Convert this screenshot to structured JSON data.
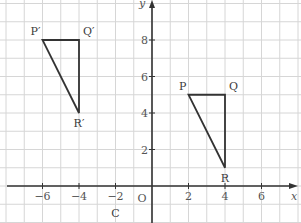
{
  "diagram": {
    "type": "coordinate-grid-transformation",
    "axes": {
      "x_label": "x",
      "y_label": "y",
      "origin_label": "O",
      "x_ticks": [
        {
          "value": -6,
          "label": "−6"
        },
        {
          "value": -4,
          "label": "−4"
        },
        {
          "value": -2,
          "label": "−2"
        },
        {
          "value": 2,
          "label": "2"
        },
        {
          "value": 4,
          "label": "4"
        },
        {
          "value": 6,
          "label": "6"
        }
      ],
      "y_ticks": [
        {
          "value": 2,
          "label": "2"
        },
        {
          "value": 4,
          "label": "4"
        },
        {
          "value": 6,
          "label": "6"
        },
        {
          "value": 8,
          "label": "8"
        }
      ]
    },
    "triangles": [
      {
        "name": "PQR",
        "vertices": [
          {
            "label": "P",
            "x": 2,
            "y": 5
          },
          {
            "label": "Q",
            "x": 4,
            "y": 5
          },
          {
            "label": "R",
            "x": 4,
            "y": 1
          }
        ]
      },
      {
        "name": "P'Q'R'",
        "vertices": [
          {
            "label": "P′",
            "x": -6,
            "y": 8
          },
          {
            "label": "Q′",
            "x": -4,
            "y": 8
          },
          {
            "label": "R′",
            "x": -4,
            "y": 4
          }
        ]
      }
    ],
    "point_label_c": "C",
    "colors": {
      "grid": "#d6d6d6",
      "axis": "#333333",
      "shape": "#333333"
    }
  }
}
